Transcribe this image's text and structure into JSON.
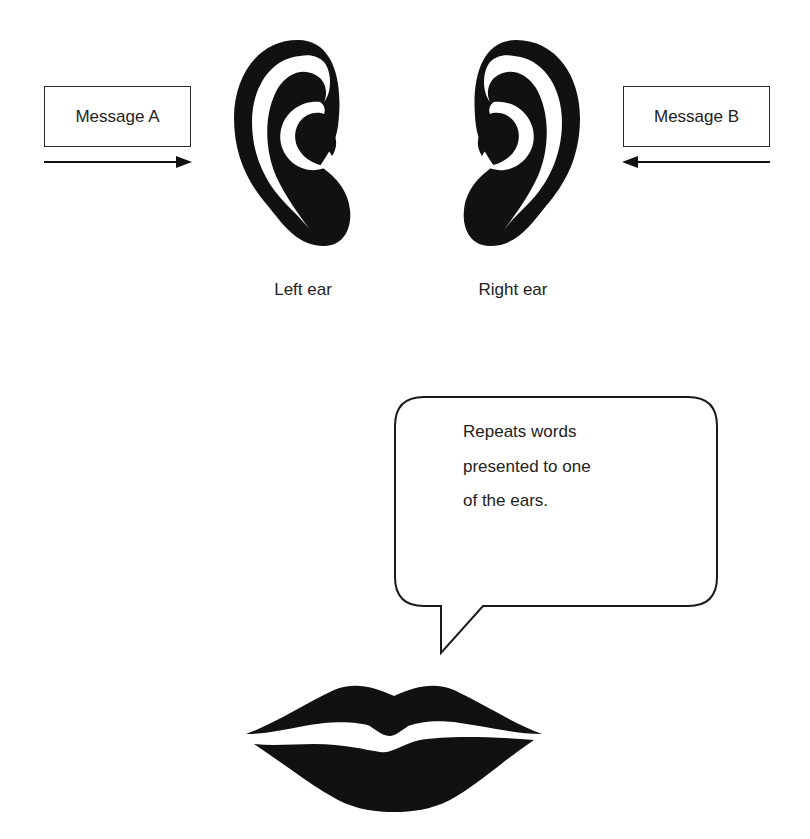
{
  "diagram": {
    "messages": [
      {
        "label": "Message A",
        "side": "left",
        "arrow_direction": "right"
      },
      {
        "label": "Message B",
        "side": "right",
        "arrow_direction": "left"
      }
    ],
    "ears": [
      {
        "label": "Left ear",
        "icon": "ear-icon"
      },
      {
        "label": "Right ear",
        "icon": "ear-icon"
      }
    ],
    "speech_bubble": {
      "lines": [
        "Repeats words",
        "presented to one",
        "of the ears."
      ]
    },
    "mouth": {
      "icon": "lips-icon"
    },
    "colors": {
      "ink": "#111111",
      "text": "#222222",
      "background": "#ffffff"
    }
  }
}
